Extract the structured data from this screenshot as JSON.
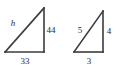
{
  "figure": {
    "background_color": "#ffffff",
    "stroke_color": "#3b3b3f",
    "label_color": "#2b2b2e",
    "triangles": [
      {
        "name": "left-triangle",
        "unknown_side": "h",
        "labels": {
          "hypotenuse": "h",
          "vertical_leg": "44",
          "horizontal_leg": "33"
        },
        "geometry": {
          "bottom_left_x": 5,
          "bottom_left_y": 52,
          "bottom_right_x": 44,
          "bottom_right_y": 52,
          "apex_x": 44,
          "apex_y": 8
        },
        "label_positions": {
          "hypotenuse_x": 13,
          "hypotenuse_y": 24,
          "vertical_leg_x": 51,
          "vertical_leg_y": 31,
          "horizontal_leg_x": 25,
          "horizontal_leg_y": 62
        }
      },
      {
        "name": "right-triangle",
        "unknown_side": "",
        "labels": {
          "hypotenuse": "5",
          "vertical_leg": "4",
          "horizontal_leg": "3"
        },
        "geometry": {
          "bottom_left_x": 74,
          "bottom_left_y": 52,
          "bottom_right_x": 103,
          "bottom_right_y": 52,
          "apex_x": 103,
          "apex_y": 11
        },
        "label_positions": {
          "hypotenuse_x": 80,
          "hypotenuse_y": 31,
          "vertical_leg_x": 109,
          "vertical_leg_y": 32,
          "horizontal_leg_x": 89,
          "horizontal_leg_y": 62
        }
      }
    ]
  }
}
